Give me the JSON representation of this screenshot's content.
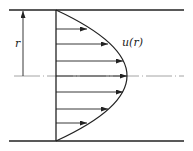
{
  "diagram": {
    "labels": {
      "radius": "r",
      "velocity": "u(r)"
    },
    "colors": {
      "stroke": "#222222",
      "centerline": "#9a9a9a",
      "background": "#ffffff"
    },
    "geometry": {
      "top_wall_y": 10,
      "bottom_wall_y": 141,
      "centerline_y": 76,
      "wall_x_start": 9,
      "wall_x_end": 184,
      "profile_base_x": 56,
      "profile_max_x": 127
    },
    "arrows": [
      {
        "y": 29,
        "tip_x": 87
      },
      {
        "y": 44,
        "tip_x": 108
      },
      {
        "y": 61,
        "tip_x": 123
      },
      {
        "y": 76,
        "tip_x": 127
      },
      {
        "y": 92,
        "tip_x": 123
      },
      {
        "y": 109,
        "tip_x": 108
      },
      {
        "y": 123,
        "tip_x": 87
      }
    ]
  }
}
